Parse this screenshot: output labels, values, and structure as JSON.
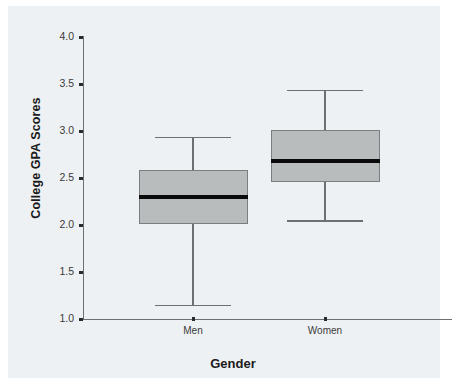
{
  "chart_data": {
    "type": "box",
    "title": "",
    "xlabel": "Gender",
    "ylabel": "College GPA Scores",
    "categories": [
      "Men",
      "Women"
    ],
    "ylim": [
      1.0,
      4.0
    ],
    "ytick_labels": [
      "4.0",
      "3.5",
      "3.0",
      "2.5",
      "2.0",
      "1.5",
      "1.0"
    ],
    "ytick_values": [
      4.0,
      3.5,
      3.0,
      2.5,
      2.0,
      1.5,
      1.0
    ],
    "grid": false,
    "legend": "none",
    "boxes": [
      {
        "label": "Men",
        "whisker_low": 1.15,
        "q1": 2.01,
        "median": 2.3,
        "q3": 2.58,
        "whisker_high": 2.94
      },
      {
        "label": "Women",
        "whisker_low": 2.05,
        "q1": 2.46,
        "median": 2.68,
        "q3": 3.01,
        "whisker_high": 3.44
      }
    ],
    "colors": {
      "box_fill": "#b9bcbd",
      "box_border": "#7b7e80",
      "median": "#0a0a0a",
      "whisker": "#6d6f72",
      "axis": "#6d6f72",
      "panel_background": "#eef1f3",
      "page_background": "#ffffff",
      "text": "#1b1b1b"
    }
  }
}
